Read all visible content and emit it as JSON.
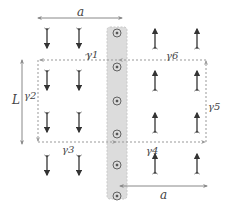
{
  "diagram": {
    "type": "domain-wall magnetization schematic",
    "colors": {
      "arrow": "#333333",
      "dashed_path": "#999999",
      "strip_fill": "#dcdcdc",
      "strip_edge": "#c4c4c4",
      "dimension_line": "#888888",
      "label": "#444444"
    },
    "labels": {
      "a_top": "a",
      "a_bottom": "a",
      "L": "L",
      "gamma1": "γ1",
      "gamma2": "γ2",
      "gamma3": "γ3",
      "gamma4": "γ4",
      "gamma5": "γ5",
      "gamma6": "γ6"
    },
    "left_region": {
      "spin_direction": "down",
      "columns": 2,
      "rows": 3
    },
    "right_region": {
      "spin_direction": "up",
      "columns": 2,
      "rows": 3
    },
    "domain_wall": {
      "symbol": "out-of-page (⊙)",
      "count": 6
    }
  }
}
